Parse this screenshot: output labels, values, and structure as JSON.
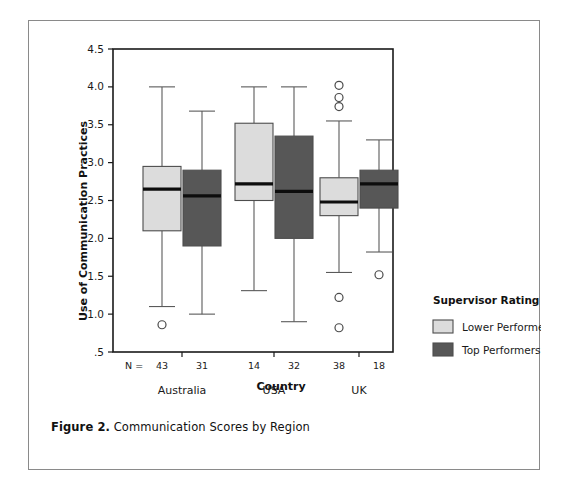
{
  "figure": {
    "caption_label": "Figure 2.",
    "caption_text": " Communication Scores by Region"
  },
  "chart_data": {
    "type": "box",
    "title": "",
    "xlabel": "Country",
    "ylabel": "Use of Communication Practices",
    "ylim": [
      0.5,
      4.5
    ],
    "ytick_labels": [
      "4.5",
      "4.0",
      "3.5",
      "3.0",
      "2.5",
      "2.0",
      "1.5",
      "1.0",
      ".5"
    ],
    "ytick_values": [
      4.5,
      4.0,
      3.5,
      3.0,
      2.5,
      2.0,
      1.5,
      1.0,
      0.5
    ],
    "grid": false,
    "categories": [
      "Australia",
      "USA",
      "UK"
    ],
    "n_prefix": "N =",
    "legend": {
      "title": "Supervisor Rating",
      "position": "right",
      "entries": [
        {
          "label": "Lower Performers",
          "color": "#dcdcdc"
        },
        {
          "label": "Top Performers",
          "color": "#575757"
        }
      ]
    },
    "series": [
      {
        "name": "Lower Performers",
        "color": "#dcdcdc",
        "boxes": [
          {
            "category": "Australia",
            "n": 43,
            "whisker_low": 1.1,
            "q1": 2.1,
            "median": 2.65,
            "q3": 2.95,
            "whisker_high": 4.0,
            "outliers": [
              0.86
            ]
          },
          {
            "category": "USA",
            "n": 14,
            "whisker_low": 1.31,
            "q1": 2.5,
            "median": 2.72,
            "q3": 3.52,
            "whisker_high": 4.0,
            "outliers": []
          },
          {
            "category": "UK",
            "n": 38,
            "whisker_low": 1.55,
            "q1": 2.3,
            "median": 2.48,
            "q3": 2.8,
            "whisker_high": 3.55,
            "outliers": [
              4.02,
              3.86,
              3.74,
              1.22,
              0.82
            ]
          }
        ]
      },
      {
        "name": "Top Performers",
        "color": "#575757",
        "boxes": [
          {
            "category": "Australia",
            "n": 31,
            "whisker_low": 1.0,
            "q1": 1.9,
            "median": 2.56,
            "q3": 2.9,
            "whisker_high": 3.68,
            "outliers": []
          },
          {
            "category": "USA",
            "n": 32,
            "whisker_low": 0.9,
            "q1": 2.0,
            "median": 2.62,
            "q3": 3.35,
            "whisker_high": 4.0,
            "outliers": []
          },
          {
            "category": "UK",
            "n": 18,
            "whisker_low": 1.82,
            "q1": 2.4,
            "median": 2.72,
            "q3": 2.9,
            "whisker_high": 3.3,
            "outliers": [
              1.52
            ]
          }
        ]
      }
    ]
  }
}
